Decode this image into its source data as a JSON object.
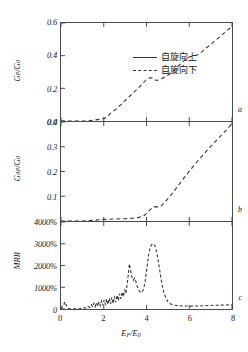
{
  "chart_data": [
    {
      "type": "line",
      "panel": "a",
      "title": "",
      "xlabel": "E_F/E_0",
      "ylabel": "G_P/G_0",
      "xlim": [
        0,
        8
      ],
      "ylim": [
        0.0,
        0.6
      ],
      "yticks": [
        "0.6",
        "0.4",
        "0.2",
        "0.0"
      ],
      "ytick_values": [
        0.6,
        0.4,
        0.2,
        0.0
      ],
      "xticks": [
        "0",
        "2",
        "4",
        "6",
        "8"
      ],
      "grid": false,
      "legend_position": "upper-left",
      "series": [
        {
          "name": "自旋向下",
          "style": "dashed",
          "x": [
            0.0,
            0.3,
            0.6,
            0.9,
            1.2,
            1.5,
            1.8,
            2.0,
            2.15,
            2.3,
            2.45,
            2.6,
            2.8,
            3.0,
            3.2,
            3.4,
            3.6,
            3.8,
            4.0,
            4.15,
            4.3,
            4.45,
            4.6,
            4.75,
            4.9,
            5.05,
            5.2,
            5.4,
            5.6,
            5.8,
            6.0,
            6.2,
            6.4,
            6.6,
            6.8,
            7.0,
            7.2,
            7.4,
            7.6,
            7.8,
            8.0
          ],
          "y": [
            0.0,
            0.0,
            0.0,
            0.0,
            0.0,
            0.005,
            0.01,
            0.015,
            0.025,
            0.045,
            0.06,
            0.075,
            0.1,
            0.125,
            0.15,
            0.175,
            0.2,
            0.225,
            0.255,
            0.265,
            0.262,
            0.248,
            0.252,
            0.262,
            0.272,
            0.285,
            0.3,
            0.325,
            0.35,
            0.375,
            0.392,
            0.398,
            0.405,
            0.425,
            0.448,
            0.468,
            0.492,
            0.512,
            0.535,
            0.558,
            0.578
          ]
        }
      ]
    },
    {
      "type": "line",
      "panel": "b",
      "title": "",
      "xlabel": "E_F/E_0",
      "ylabel": "G_AP/G_0",
      "xlim": [
        0,
        8
      ],
      "ylim": [
        0.0,
        0.4
      ],
      "yticks": [
        "0.4",
        "0.3",
        "0.2",
        "0.1"
      ],
      "ytick_values": [
        0.4,
        0.3,
        0.2,
        0.1
      ],
      "xticks": [
        "0",
        "2",
        "4",
        "6",
        "8"
      ],
      "grid": false,
      "series": [
        {
          "name": "自旋向下",
          "style": "dashed",
          "x": [
            0.0,
            0.5,
            1.0,
            1.4,
            1.8,
            2.0,
            2.2,
            2.4,
            2.6,
            2.8,
            3.0,
            3.2,
            3.4,
            3.6,
            3.8,
            3.95,
            4.1,
            4.25,
            4.4,
            4.55,
            4.7,
            4.9,
            5.1,
            5.3,
            5.5,
            5.7,
            5.9,
            6.1,
            6.3,
            6.5,
            6.7,
            6.9,
            7.1,
            7.3,
            7.5,
            7.7,
            7.9,
            8.0
          ],
          "y": [
            0.0,
            0.0,
            0.0,
            0.002,
            0.005,
            0.006,
            0.007,
            0.008,
            0.008,
            0.009,
            0.009,
            0.01,
            0.012,
            0.014,
            0.018,
            0.026,
            0.04,
            0.052,
            0.058,
            0.056,
            0.062,
            0.08,
            0.1,
            0.122,
            0.145,
            0.168,
            0.19,
            0.212,
            0.233,
            0.252,
            0.272,
            0.292,
            0.31,
            0.328,
            0.346,
            0.364,
            0.384,
            0.398
          ]
        }
      ]
    },
    {
      "type": "line",
      "panel": "c",
      "title": "",
      "xlabel": "E_F/E_0",
      "ylabel": "MRR",
      "xlim": [
        0,
        8
      ],
      "ylim": [
        0,
        4000
      ],
      "yticks": [
        "4000%",
        "3000%",
        "2000%",
        "1000%",
        "0"
      ],
      "ytick_values": [
        4000,
        3000,
        2000,
        1000,
        0
      ],
      "xticks": [
        "0",
        "2",
        "4",
        "6",
        "8"
      ],
      "grid": false,
      "units": "percent",
      "series": [
        {
          "name": "MRR",
          "style": "dashed",
          "x": [
            0.0,
            0.1,
            0.18,
            0.26,
            0.35,
            0.5,
            0.7,
            0.9,
            1.05,
            1.15,
            1.25,
            1.35,
            1.42,
            1.48,
            1.54,
            1.6,
            1.66,
            1.72,
            1.78,
            1.84,
            1.9,
            1.96,
            2.02,
            2.08,
            2.14,
            2.2,
            2.26,
            2.32,
            2.38,
            2.44,
            2.5,
            2.56,
            2.62,
            2.68,
            2.74,
            2.8,
            2.86,
            2.92,
            2.98,
            3.04,
            3.1,
            3.16,
            3.2,
            3.26,
            3.32,
            3.38,
            3.44,
            3.5,
            3.56,
            3.62,
            3.7,
            3.78,
            3.86,
            3.94,
            4.02,
            4.1,
            4.18,
            4.26,
            4.32,
            4.4,
            4.48,
            4.56,
            4.64,
            4.72,
            4.8,
            4.9,
            5.0,
            5.1,
            5.2,
            5.35,
            5.5,
            5.7,
            5.9,
            6.1,
            6.3,
            6.5,
            6.7,
            6.9,
            7.1,
            7.3,
            7.5,
            7.7,
            7.9,
            8.0
          ],
          "y": [
            0,
            120,
            330,
            140,
            20,
            10,
            10,
            20,
            60,
            40,
            120,
            70,
            200,
            90,
            260,
            110,
            300,
            130,
            340,
            150,
            380,
            170,
            420,
            190,
            460,
            210,
            500,
            230,
            540,
            250,
            580,
            300,
            640,
            380,
            700,
            460,
            780,
            560,
            900,
            720,
            1180,
            1700,
            2080,
            1750,
            1450,
            1320,
            1420,
            1280,
            1060,
            900,
            780,
            760,
            900,
            1280,
            1900,
            2500,
            2850,
            2980,
            3000,
            2900,
            2600,
            2150,
            1650,
            1150,
            800,
            520,
            340,
            250,
            200,
            170,
            150,
            140,
            135,
            130,
            135,
            140,
            150,
            160,
            170,
            175,
            180,
            185,
            190,
            195
          ]
        }
      ]
    }
  ],
  "axis": {
    "xlabel_main": "E",
    "xlabel_sub1": "F",
    "xlabel_mid": "/E",
    "xlabel_sub2": "0",
    "ylabel_a_main": "G",
    "ylabel_a_sub": "P",
    "ylabel_a_rest": "/G",
    "ylabel_a_sub2": "0",
    "ylabel_b_main": "G",
    "ylabel_b_sub": "AP",
    "ylabel_b_rest": "/G",
    "ylabel_b_sub2": "0",
    "ylabel_c": "MRR"
  },
  "legend": {
    "items": [
      {
        "label": "自旋向上",
        "style": "solid"
      },
      {
        "label": "自旋向下",
        "style": "dashed"
      }
    ]
  },
  "panel_labels": {
    "a": "a",
    "b": "b",
    "c": "c"
  },
  "colors": {
    "curve": "#333333",
    "axis": "#4a4a4a",
    "text": "#1a1a1a"
  }
}
